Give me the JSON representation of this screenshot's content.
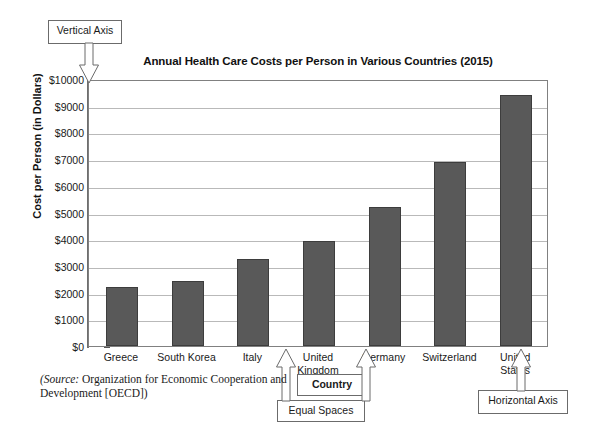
{
  "chart_data": {
    "type": "bar",
    "title": "Annual Health Care Costs per Person in Various Countries (2015)",
    "xlabel": "Country",
    "ylabel": "Cost per Person (in Dollars)",
    "categories": [
      "Greece",
      "South Korea",
      "Italy",
      "United Kingdom",
      "Germany",
      "Switzerland",
      "United States"
    ],
    "values": [
      2200,
      2450,
      3250,
      3950,
      5200,
      6900,
      9400
    ],
    "ylim": [
      0,
      10000
    ],
    "y_tick_step": 1000,
    "y_minor_tick_step": 500,
    "y_tick_labels": [
      "$0",
      "$1000",
      "$2000",
      "$3000",
      "$4000",
      "$5000",
      "$6000",
      "$7000",
      "$8000",
      "$9000",
      "$10000"
    ],
    "grid": true,
    "legend": "none",
    "bar_color": "#595959",
    "gridline_color": "#b9b9b9",
    "axis_color": "#6e6e6e"
  },
  "x_tick_lines": [
    "Greece",
    "South Korea",
    "Italy",
    "United\nKingdom",
    "Germany",
    "Switzerland",
    "United\nStates"
  ],
  "callouts": {
    "vertical_axis": "Vertical Axis",
    "horizontal_axis": "Horizontal Axis",
    "equal_spaces": "Equal Spaces",
    "country": "Country"
  },
  "source": {
    "label": "(Source:",
    "text": " Organization for Economic Cooperation and Development [OECD])",
    "full": "(Source: Organization for Economic Cooperation and Development [OECD])"
  }
}
